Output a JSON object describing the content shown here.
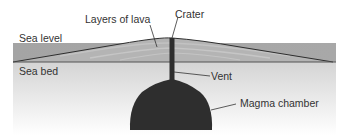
{
  "diagram": {
    "type": "volcano cross-section",
    "labels": {
      "sea_level": "Sea level",
      "sea_bed": "Sea bed",
      "layers_of_lava": "Layers of lava",
      "crater": "Crater",
      "vent": "Vent",
      "magma_chamber": "Magma chamber"
    },
    "colors": {
      "sea": "#a6a6a6",
      "lava_layers": "#b3b3b3",
      "ground_top": "#d6d6d6",
      "ground_bottom": "#ffffff",
      "magma": "#2e2e2e",
      "lines": "#333333"
    }
  }
}
